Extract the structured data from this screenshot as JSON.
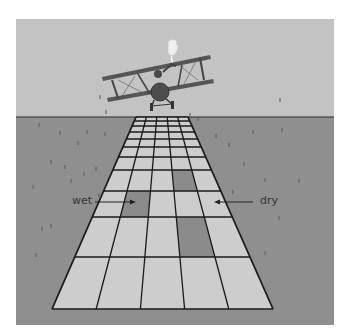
{
  "figure": {
    "labels": {
      "wet": "wet",
      "dry": "dry"
    },
    "colors": {
      "sky": "#c3c3c3",
      "ground": "#8f8f8f",
      "tile_dry": "#cdcdcd",
      "tile_wet": "#8b8b8b",
      "grid_line": "#1a1a1a",
      "plane": "#555555"
    },
    "grid": {
      "columns": 5,
      "row_lines_y": [
        117,
        121,
        126,
        132,
        139,
        147,
        157,
        170,
        191,
        217,
        257,
        309
      ],
      "top_left_x": 136,
      "top_right_x": 188,
      "bottom_left_x": 52,
      "bottom_right_x": 273,
      "wet_cells": [
        {
          "row": 7,
          "col": 3
        },
        {
          "row": 8,
          "col": 1
        },
        {
          "row": 9,
          "col": 3
        }
      ]
    },
    "annotations": [
      {
        "label": "wet",
        "points_to": "dark tile, row 8 col 1",
        "arrow_direction": "right"
      },
      {
        "label": "dry",
        "points_to": "light tile, row 8 col 4",
        "arrow_direction": "left"
      }
    ]
  }
}
